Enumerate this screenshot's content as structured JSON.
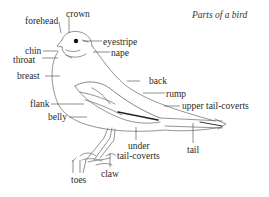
{
  "diagram": {
    "title": "Parts of a bird",
    "labels": {
      "crown": "crown",
      "forehead": "forehead",
      "eyestripe": "eyestripe",
      "chin": "chin",
      "nape": "nape",
      "throat": "throat",
      "breast": "breast",
      "back": "back",
      "rump": "rump",
      "flank": "flank",
      "upper_tail_coverts": "upper tail-coverts",
      "belly": "belly",
      "under_tail_coverts_line1": "under",
      "under_tail_coverts_line2": "tail-coverts",
      "tail": "tail",
      "claw": "claw",
      "toes": "toes"
    },
    "colors": {
      "line": "#555555",
      "eye": "#111111",
      "text": "#2a2a2a",
      "background": "#ffffff"
    }
  }
}
